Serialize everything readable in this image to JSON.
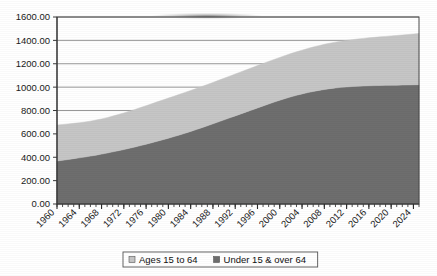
{
  "chart_data": {
    "type": "area",
    "stacked": true,
    "title": "",
    "subtitle": "",
    "xlabel": "",
    "ylabel": "",
    "grid": true,
    "legend_position": "bottom",
    "ylim": [
      0,
      1600
    ],
    "ytick_labels": [
      "0.00",
      "200.00",
      "400.00",
      "600.00",
      "800.00",
      "1000.00",
      "1200.00",
      "1400.00",
      "1600.00"
    ],
    "ytick_values": [
      0,
      200,
      400,
      600,
      800,
      1000,
      1200,
      1400,
      1600
    ],
    "xtick_labels": [
      "1960",
      "1964",
      "1968",
      "1972",
      "1976",
      "1980",
      "1984",
      "1988",
      "1992",
      "1996",
      "2000",
      "2004",
      "2008",
      "2012",
      "2016",
      "2020",
      "2024"
    ],
    "x_minor_step_years": 1,
    "xlim": [
      1960,
      2025
    ],
    "x": [
      1960,
      1961,
      1962,
      1963,
      1964,
      1965,
      1966,
      1967,
      1968,
      1969,
      1970,
      1971,
      1972,
      1973,
      1974,
      1975,
      1976,
      1977,
      1978,
      1979,
      1980,
      1981,
      1982,
      1983,
      1984,
      1985,
      1986,
      1987,
      1988,
      1989,
      1990,
      1991,
      1992,
      1993,
      1994,
      1995,
      1996,
      1997,
      1998,
      1999,
      2000,
      2001,
      2002,
      2003,
      2004,
      2005,
      2006,
      2007,
      2008,
      2009,
      2010,
      2011,
      2012,
      2013,
      2014,
      2015,
      2016,
      2017,
      2018,
      2019,
      2020,
      2021,
      2022,
      2023,
      2024,
      2025
    ],
    "series": [
      {
        "name": "Under 15 & over 64",
        "color": "#6e6e6e",
        "stack_order": 1,
        "values": [
          368,
          374,
          381,
          388,
          395,
          402,
          410,
          418,
          427,
          436,
          446,
          456,
          466,
          477,
          488,
          500,
          512,
          524,
          537,
          550,
          563,
          577,
          591,
          606,
          621,
          637,
          653,
          669,
          686,
          703,
          720,
          737,
          754,
          771,
          788,
          805,
          822,
          839,
          856,
          872,
          888,
          903,
          917,
          930,
          942,
          953,
          963,
          972,
          980,
          987,
          993,
          998,
          1002,
          1005,
          1008,
          1010,
          1012,
          1013,
          1014,
          1015,
          1016,
          1017,
          1018,
          1019,
          1020,
          1021
        ]
      },
      {
        "name": "Ages 15 to 64",
        "color": "#c6c6c6",
        "stack_order": 2,
        "values": [
          307,
          306,
          304,
          302,
          300,
          299,
          299,
          300,
          301,
          303,
          306,
          309,
          313,
          317,
          321,
          325,
          329,
          333,
          337,
          340,
          343,
          345,
          347,
          349,
          350,
          351,
          352,
          353,
          354,
          355,
          356,
          357,
          358,
          359,
          360,
          361,
          362,
          363,
          364,
          365,
          366,
          368,
          370,
          372,
          374,
          377,
          380,
          383,
          386,
          389,
          392,
          395,
          398,
          401,
          404,
          407,
          410,
          413,
          416,
          419,
          422,
          425,
          428,
          431,
          434,
          437
        ]
      }
    ],
    "totals": [
      675,
      680,
      685,
      690,
      695,
      701,
      709,
      718,
      728,
      739,
      752,
      765,
      779,
      794,
      809,
      825,
      841,
      857,
      874,
      890,
      906,
      922,
      938,
      955,
      971,
      988,
      1005,
      1022,
      1040,
      1058,
      1076,
      1094,
      1112,
      1130,
      1148,
      1166,
      1184,
      1202,
      1220,
      1237,
      1254,
      1271,
      1287,
      1302,
      1316,
      1330,
      1343,
      1355,
      1366,
      1376,
      1385,
      1393,
      1400,
      1406,
      1412,
      1417,
      1422,
      1426,
      1430,
      1434,
      1438,
      1442,
      1446,
      1450,
      1454,
      1458
    ],
    "legend": [
      {
        "label": "Ages 15 to 64",
        "color": "#c6c6c6"
      },
      {
        "label": "Under 15 & over 64",
        "color": "#6e6e6e"
      }
    ]
  }
}
